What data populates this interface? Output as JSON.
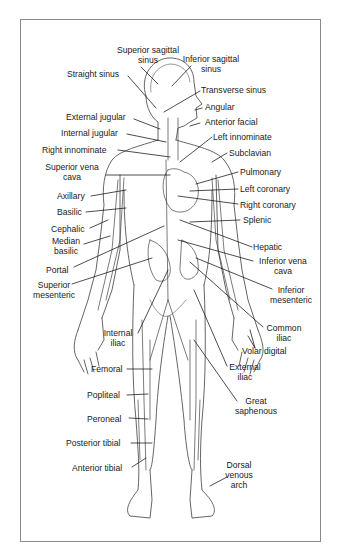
{
  "figure": {
    "frame_color": "#8a8a8a",
    "line_color": "#1a1a1a"
  },
  "labels": {
    "superior_sagittal_sinus": [
      "Superior sagittal",
      "sinus"
    ],
    "inferior_sagittal_sinus": [
      "Inferior sagittal",
      "sinus"
    ],
    "straight_sinus": "Straight sinus",
    "transverse_sinus": "Transverse sinus",
    "angular": "Angular",
    "external_jugular": "External jugular",
    "anterior_facial": "Anterior facial",
    "internal_jugular": "Internal jugular",
    "left_innominate": "Left innominate",
    "right_innominate": "Right innominate",
    "subclavian": "Subclavian",
    "superior_vena_cava": [
      "Superior vena",
      "cava"
    ],
    "pulmonary": "Pulmonary",
    "axillary": "Axillary",
    "left_coronary": "Left coronary",
    "right_coronary": "Right coronary",
    "basilic": "Basilic",
    "cephalic": "Cephalic",
    "splenic": "Splenic",
    "median_basilic": [
      "Median",
      "basilic"
    ],
    "hepatic": "Hepatic",
    "portal": "Portal",
    "inferior_vena_cava": [
      "Inferior vena",
      "cava"
    ],
    "superior_mesenteric": [
      "Superior",
      "mesenteric"
    ],
    "inferior_mesenteric": [
      "Inferior",
      "mesenteric"
    ],
    "common_iliac": [
      "Common",
      "iliac"
    ],
    "internal_iliac": [
      "Internal",
      "iliac"
    ],
    "volar_digital": "Volar digital",
    "femoral": "Femoral",
    "external_iliac": [
      "External",
      "iliac"
    ],
    "popliteal": "Popliteal",
    "great_saphenous": [
      "Great",
      "saphenous"
    ],
    "peroneal": "Peroneal",
    "posterior_tibial": "Posterior tibial",
    "anterior_tibial": "Anterior tibial",
    "dorsal_venous_arch": [
      "Dorsal",
      "venous",
      "arch"
    ]
  }
}
